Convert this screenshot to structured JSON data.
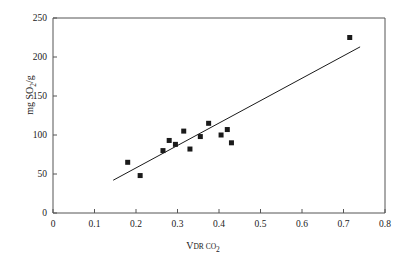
{
  "chart_data": {
    "type": "scatter",
    "title": "",
    "xlabel": "V DR CO2",
    "xlabel_parts": {
      "main": "V",
      "sub1": "DR CO",
      "sub2": "2"
    },
    "ylabel": "mg SO2/g",
    "ylabel_parts": {
      "pre": "mg SO",
      "sub": "2",
      "post": "/g"
    },
    "xlim": [
      0,
      0.8
    ],
    "ylim": [
      0,
      250
    ],
    "xticks": [
      0,
      0.1,
      0.2,
      0.3,
      0.4,
      0.5,
      0.6,
      0.7,
      0.8
    ],
    "xtick_labels": [
      "0",
      "0.1",
      "0.2",
      "0.3",
      "0.4",
      "0.5",
      "0.6",
      "0.7",
      "0.8"
    ],
    "yticks": [
      0,
      50,
      100,
      150,
      200,
      250
    ],
    "ytick_labels": [
      "0",
      "50",
      "100",
      "150",
      "200",
      "250"
    ],
    "grid": false,
    "legend": false,
    "marker": "square",
    "marker_color": "#1a1a1a",
    "marker_size": 5,
    "points": [
      {
        "x": 0.18,
        "y": 65
      },
      {
        "x": 0.21,
        "y": 48
      },
      {
        "x": 0.265,
        "y": 80
      },
      {
        "x": 0.28,
        "y": 93
      },
      {
        "x": 0.295,
        "y": 88
      },
      {
        "x": 0.315,
        "y": 105
      },
      {
        "x": 0.33,
        "y": 82
      },
      {
        "x": 0.355,
        "y": 98
      },
      {
        "x": 0.375,
        "y": 115
      },
      {
        "x": 0.405,
        "y": 100
      },
      {
        "x": 0.42,
        "y": 107
      },
      {
        "x": 0.43,
        "y": 90
      },
      {
        "x": 0.715,
        "y": 225
      }
    ],
    "trendline": {
      "type": "linear",
      "x_start": 0.145,
      "y_start": 42,
      "x_end": 0.74,
      "y_end": 213,
      "color": "#1a1a1a",
      "width": 1
    },
    "axis_color": "#555555",
    "frame": {
      "top": true,
      "right": true,
      "bottom": true,
      "left": true
    }
  }
}
